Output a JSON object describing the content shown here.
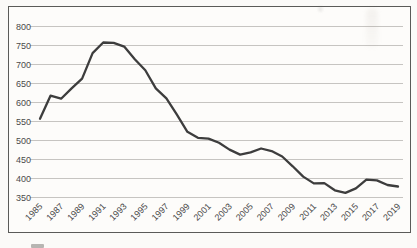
{
  "chart_data": {
    "type": "line",
    "title": "",
    "xlabel": "",
    "ylabel": "",
    "x": [
      1985,
      1986,
      1987,
      1988,
      1989,
      1990,
      1991,
      1992,
      1993,
      1994,
      1995,
      1996,
      1997,
      1998,
      1999,
      2000,
      2001,
      2002,
      2003,
      2004,
      2005,
      2006,
      2007,
      2008,
      2009,
      2010,
      2011,
      2012,
      2013,
      2014,
      2015,
      2016,
      2017,
      2018,
      2019
    ],
    "values": [
      557,
      618,
      610,
      637,
      663,
      730,
      758,
      757,
      747,
      714,
      685,
      637,
      611,
      568,
      523,
      507,
      505,
      494,
      476,
      463,
      469,
      479,
      472,
      458,
      432,
      405,
      387,
      388,
      369,
      362,
      374,
      397,
      395,
      383,
      379
    ],
    "x_tick_labels": [
      "1985",
      "1987",
      "1989",
      "1991",
      "1993",
      "1995",
      "1997",
      "1999",
      "2001",
      "2003",
      "2005",
      "2007",
      "2009",
      "2011",
      "2013",
      "2015",
      "2017",
      "2019"
    ],
    "x_tick_years": [
      1985,
      1987,
      1989,
      1991,
      1993,
      1995,
      1997,
      1999,
      2001,
      2003,
      2005,
      2007,
      2009,
      2011,
      2013,
      2015,
      2017,
      2019
    ],
    "y_ticks": [
      800,
      750,
      700,
      650,
      600,
      550,
      500,
      450,
      400,
      350
    ],
    "ylim": [
      350,
      800
    ],
    "xlim": [
      1985,
      2019
    ],
    "grid": "horizontal-only",
    "legend": "none",
    "colors": {
      "line": "#3d3d3d",
      "gridline": "#bfbdba",
      "tick_text": "#4a4a4a",
      "frame_border": "#5a5a58",
      "plot_background": "#fdfcfa"
    }
  }
}
